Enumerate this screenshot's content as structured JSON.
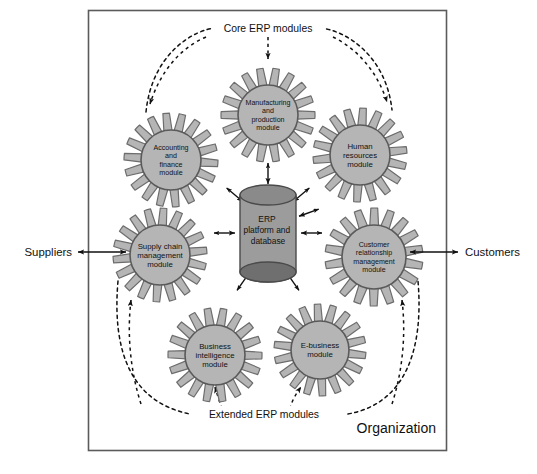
{
  "figure": {
    "kind": "erp-system-diagram",
    "boundary_label": "Organization",
    "center": {
      "label_line1": "ERP",
      "label_line2": "platform and",
      "label_line3": "database",
      "shape": "cylinder"
    },
    "group_labels": {
      "core": "Core ERP modules",
      "extended": "Extended ERP modules"
    },
    "external": {
      "left": "Suppliers",
      "right": "Customers"
    },
    "modules": [
      {
        "id": "manufacturing",
        "group": "core",
        "lines": [
          "Manufacturing",
          "and",
          "production",
          "module"
        ]
      },
      {
        "id": "accounting",
        "group": "core",
        "lines": [
          "Accounting",
          "and",
          "finance",
          "module"
        ]
      },
      {
        "id": "human-resources",
        "group": "core",
        "lines": [
          "Human",
          "resources",
          "module"
        ]
      },
      {
        "id": "supply-chain",
        "group": "extended",
        "lines": [
          "Supply chain",
          "management",
          "module"
        ]
      },
      {
        "id": "customer-relationship",
        "group": "extended",
        "lines": [
          "Customer",
          "relationship",
          "management",
          "module"
        ]
      },
      {
        "id": "business-intelligence",
        "group": "extended",
        "lines": [
          "Business",
          "intelligence",
          "module"
        ]
      },
      {
        "id": "e-business",
        "group": "extended",
        "lines": [
          "E-business",
          "module"
        ]
      }
    ],
    "colors": {
      "gear_fill": "#b5b5b5",
      "gear_stroke": "#6d6d6d",
      "hub_fill": "#b5b5b5",
      "hub_stroke": "#5a5a5a",
      "cylinder_body": "#9c9c9c",
      "cylinder_top": "#8a8a8a",
      "cylinder_bottom": "#6f6f6f",
      "cylinder_stroke": "#4a4a4a",
      "border": "#5b5b5b",
      "text": "#111111",
      "arrow": "#111111",
      "page_bg": "#ffffff"
    }
  }
}
